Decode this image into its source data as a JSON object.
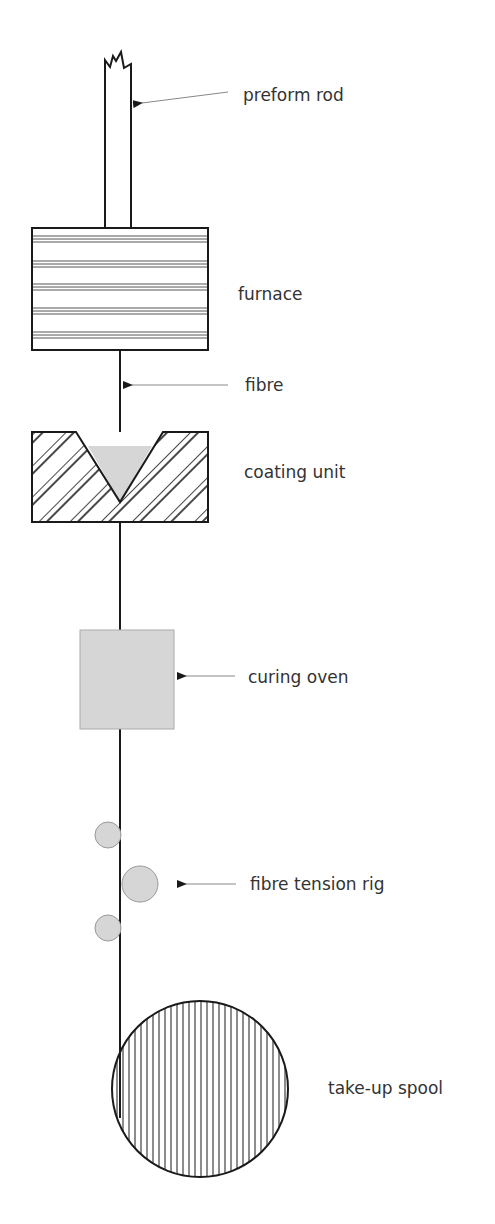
{
  "labels": {
    "preform_rod": "preform rod",
    "furnace": "furnace",
    "fibre": "fibre",
    "coating_unit": "coating unit",
    "curing_oven": "curing oven",
    "fibre_tension_rig": "fibre tension rig",
    "take_up_spool": "take-up spool"
  },
  "colors": {
    "line": "#1a1a1a",
    "fill_gray": "#d6d6d6",
    "leader": "#888888",
    "text": "#333333"
  }
}
